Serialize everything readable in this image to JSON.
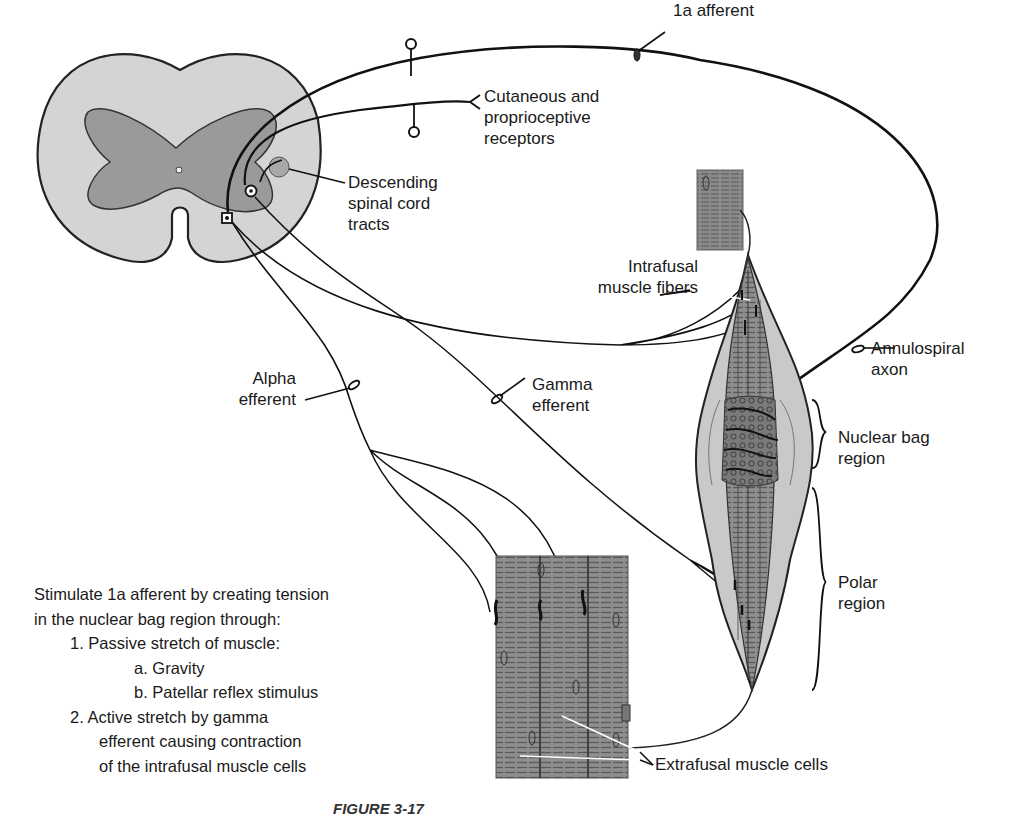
{
  "figure": {
    "caption_label": "FIGURE 3-17",
    "caption_text": "(caption truncated at image bottom)"
  },
  "labels": {
    "ia_afferent": "1a afferent",
    "cutaneous": [
      "Cutaneous and",
      "proprioceptive",
      "receptors"
    ],
    "descending": [
      "Descending",
      "spinal cord",
      "tracts"
    ],
    "intrafusal": [
      "Intrafusal",
      "muscle fibers"
    ],
    "annulospiral": [
      "Annulospiral",
      "axon"
    ],
    "alpha": [
      "Alpha",
      "efferent"
    ],
    "gamma": [
      "Gamma",
      "efferent"
    ],
    "nuclear_bag": [
      "Nuclear bag",
      "region"
    ],
    "polar": [
      "Polar",
      "region"
    ],
    "extrafusal": "Extrafusal muscle cells"
  },
  "notes": {
    "intro_1": "Stimulate 1a afferent by creating tension",
    "intro_2": "in the nuclear bag region through:",
    "item_1": "1.  Passive stretch of muscle:",
    "item_1a": "a.  Gravity",
    "item_1b": "b.  Patellar reflex stimulus",
    "item_2_1": "2.  Active stretch by gamma",
    "item_2_2": "efferent causing contraction",
    "item_2_3": "of the intrafusal muscle cells"
  },
  "colors": {
    "white_matter": "#d4d4d4",
    "gray_matter": "#9a9a9a",
    "muscle_fill": "#8e8e8e",
    "spindle_capsule": "#c9c9c9",
    "line": "#111111"
  }
}
